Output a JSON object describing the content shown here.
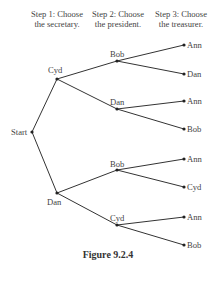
{
  "steps": [
    {
      "line1": "Step 1: Choose",
      "line2": "the secretary."
    },
    {
      "line1": "Step 2: Choose",
      "line2": "the president."
    },
    {
      "line1": "Step 3: Choose",
      "line2": "the treasurer."
    }
  ],
  "tree": {
    "root": "Start",
    "level1": [
      "Cyd",
      "Dan"
    ],
    "level2": [
      "Bob",
      "Dan",
      "Bob",
      "Cyd"
    ],
    "leaves": [
      "Ann",
      "Dan",
      "Ann",
      "Bob",
      "Ann",
      "Cyd",
      "Ann",
      "Bob"
    ]
  },
  "caption": "Figure 9.2.4",
  "colors": {
    "line": "#333333",
    "text": "#444444"
  }
}
